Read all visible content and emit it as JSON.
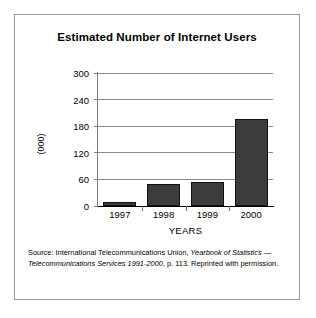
{
  "figure": {
    "title": "Estimated Number of Internet Users",
    "source_prefix": "Source: International Telecommunications Union, ",
    "source_italic_1": "Yearbook of Statistics — Telecommunications Services 1991-2000",
    "source_suffix": ", p. 113. Reprinted with permission."
  },
  "chart_data": {
    "type": "bar",
    "title": "Estimated Number of Internet Users",
    "categories": [
      "1997",
      "1998",
      "1999",
      "2000"
    ],
    "values": [
      9,
      50,
      54,
      196
    ],
    "xlabel": "YEARS",
    "ylabel": "(000)",
    "ylim": [
      0,
      300
    ],
    "yticks": [
      0,
      60,
      120,
      180,
      240,
      300
    ],
    "ytick_labels": [
      "0",
      "60",
      "120",
      "180",
      "240",
      "300"
    ],
    "grid": true,
    "legend": false,
    "bar_color": "#3c3c3c",
    "bar_edge_color": "#111111"
  }
}
